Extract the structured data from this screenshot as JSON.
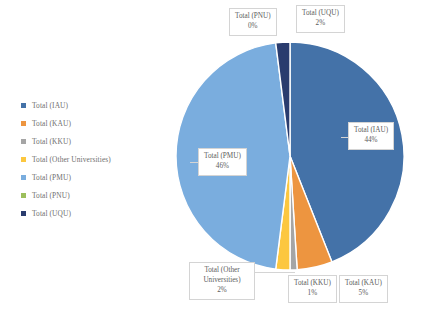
{
  "chart_data": {
    "type": "pie",
    "title": "",
    "categories": [
      "Total (IAU)",
      "Total (KAU)",
      "Total (KKU)",
      "Total (Other Universities)",
      "Total (PMU)",
      "Total (PNU)",
      "Total (UQU)"
    ],
    "values": [
      44,
      5,
      1,
      2,
      46,
      0,
      2
    ],
    "value_labels": [
      "44%",
      "5%",
      "1%",
      "2%",
      "46%",
      "0%",
      "2%"
    ],
    "unit": "%",
    "colors": [
      "#4472a8",
      "#ed9540",
      "#a5a5a5",
      "#fcc73f",
      "#7aadde",
      "#9cbf5c",
      "#2a3c6e"
    ],
    "legend": {
      "position": "left",
      "entries": [
        {
          "label": "Total (IAU)",
          "color": "#4472a8"
        },
        {
          "label": "Total (KAU)",
          "color": "#ed9540"
        },
        {
          "label": "Total (KKU)",
          "color": "#a5a5a5"
        },
        {
          "label": "Total (Other Universities)",
          "color": "#fcc73f"
        },
        {
          "label": "Total (PMU)",
          "color": "#7aadde"
        },
        {
          "label": "Total (PNU)",
          "color": "#9cbf5c"
        },
        {
          "label": "Total (UQU)",
          "color": "#2a3c6e"
        }
      ]
    },
    "data_labels": [
      {
        "name": "Total (PNU)",
        "percent": "0%"
      },
      {
        "name": "Total (UQU)",
        "percent": "2%"
      },
      {
        "name": "Total (IAU)",
        "percent": "44%"
      },
      {
        "name": "Total (PMU)",
        "percent": "46%"
      },
      {
        "name": "Total (Other Universities)",
        "percent": "2%"
      },
      {
        "name": "Total (KKU)",
        "percent": "1%"
      },
      {
        "name": "Total (KAU)",
        "percent": "5%"
      }
    ],
    "grid": false,
    "start_angle_deg": 0,
    "background": "#ffffff"
  },
  "labels": {
    "pnu_name": "Total (PNU)",
    "pnu_pct": "0%",
    "uqu_name": "Total (UQU)",
    "uqu_pct": "2%",
    "iau_name": "Total (IAU)",
    "iau_pct": "44%",
    "pmu_name": "Total (PMU)",
    "pmu_pct": "46%",
    "other_name": "Total (Other Universities)",
    "other_pct": "2%",
    "kku_name": "Total (KKU)",
    "kku_pct": "1%",
    "kau_name": "Total (KAU)",
    "kau_pct": "5%"
  }
}
